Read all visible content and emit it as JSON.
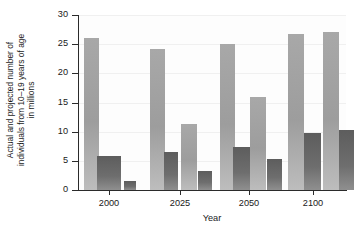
{
  "chart_data": {
    "type": "bar",
    "title": "",
    "subtitle": "",
    "xlabel": "Year",
    "ylabel": "Actual and projected number of individuals from 10–19 years of age in millions",
    "ylabel_lines": [
      "Actual and projected number of",
      "individuals from 10–19 years of age",
      "in millions"
    ],
    "categories": [
      "2000",
      "2025",
      "2050",
      "2100"
    ],
    "xtick_labels": [
      "2000",
      "2025",
      "2050",
      "2100"
    ],
    "ytick_labels": [
      "0",
      "5",
      "10",
      "15",
      "20",
      "25",
      "30"
    ],
    "ytick_values": [
      0,
      5,
      10,
      15,
      20,
      25,
      30
    ],
    "ylim": [
      0,
      30
    ],
    "grid": true,
    "legend": "none",
    "series": [
      {
        "name": "light-series",
        "color": "#a3a3a3",
        "values": [
          26.0,
          24.1,
          25.0,
          26.8
        ]
      },
      {
        "name": "dark-series",
        "color": "#666666",
        "values": [
          5.8,
          6.5,
          7.3,
          9.8
        ]
      }
    ],
    "bars": [
      {
        "group": "2000",
        "series": "light-series",
        "value": 26.0
      },
      {
        "group": "2000",
        "series": "dark-series",
        "value": 5.8
      },
      {
        "group": "2000",
        "series": "dark-series-2",
        "value": 1.5
      },
      {
        "group": "2025",
        "series": "light-series",
        "value": 24.1
      },
      {
        "group": "2025",
        "series": "dark-series",
        "value": 6.5
      },
      {
        "group": "2025",
        "series": "light-series-2",
        "value": 11.3
      },
      {
        "group": "2025",
        "series": "dark-series-2",
        "value": 3.2
      },
      {
        "group": "2050",
        "series": "light-series",
        "value": 25.0
      },
      {
        "group": "2050",
        "series": "dark-series",
        "value": 7.3
      },
      {
        "group": "2050",
        "series": "light-series-2",
        "value": 16.0
      },
      {
        "group": "2050",
        "series": "dark-series-2",
        "value": 5.3
      },
      {
        "group": "2100",
        "series": "light-series",
        "value": 26.8
      },
      {
        "group": "2100",
        "series": "dark-series",
        "value": 9.8
      },
      {
        "group": "2100",
        "series": "light-series-2",
        "value": 27.1
      },
      {
        "group": "2100",
        "series": "dark-series-2",
        "value": 10.3
      }
    ],
    "bar_geometry": [
      {
        "x": 6,
        "w": 15,
        "value": 26.0,
        "tone": "light"
      },
      {
        "x": 19,
        "w": 24,
        "value": 5.8,
        "tone": "dark"
      },
      {
        "x": 46,
        "w": 12,
        "value": 1.5,
        "tone": "dark"
      },
      {
        "x": 72,
        "w": 15,
        "value": 24.1,
        "tone": "light"
      },
      {
        "x": 86,
        "w": 14,
        "value": 6.5,
        "tone": "dark"
      },
      {
        "x": 103,
        "w": 16,
        "value": 11.3,
        "tone": "light"
      },
      {
        "x": 120,
        "w": 14,
        "value": 3.2,
        "tone": "dark"
      },
      {
        "x": 142,
        "w": 15,
        "value": 25.0,
        "tone": "light"
      },
      {
        "x": 155,
        "w": 17,
        "value": 7.3,
        "tone": "dark"
      },
      {
        "x": 172,
        "w": 16,
        "value": 16.0,
        "tone": "light"
      },
      {
        "x": 189,
        "w": 15,
        "value": 5.3,
        "tone": "dark"
      },
      {
        "x": 210,
        "w": 16,
        "value": 26.8,
        "tone": "light"
      },
      {
        "x": 226,
        "w": 17,
        "value": 9.8,
        "tone": "dark"
      },
      {
        "x": 245,
        "w": 16,
        "value": 27.1,
        "tone": "light"
      },
      {
        "x": 261,
        "w": 15,
        "value": 10.3,
        "tone": "dark"
      }
    ],
    "xtick_positions": [
      31,
      102,
      171,
      235
    ],
    "colors": {
      "light_bar": "#a3a3a3",
      "dark_bar": "#666666",
      "axis": "#2b2b2b",
      "grid": "#f0f0f0",
      "text": "#1a1a1a",
      "plot_bg": "#fdfdfd"
    }
  }
}
